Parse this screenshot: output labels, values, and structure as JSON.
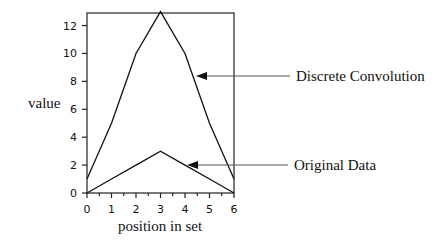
{
  "chart_data": {
    "type": "line",
    "title": "",
    "xlabel": "position in set",
    "ylabel": "value",
    "x": [
      0,
      1,
      2,
      3,
      4,
      5,
      6
    ],
    "xlim": [
      0,
      6
    ],
    "ylim": [
      0,
      12.9
    ],
    "xticks": [
      "0",
      "1",
      "2",
      "3",
      "4",
      "5",
      "6"
    ],
    "yticks": [
      "0",
      "2",
      "4",
      "6",
      "8",
      "10",
      "12"
    ],
    "grid": false,
    "legend": "none (inline arrow annotations)",
    "series": [
      {
        "name": "Discrete Convolution",
        "values": [
          1,
          5,
          10,
          13,
          10,
          5,
          1
        ]
      },
      {
        "name": "Original Data",
        "values": [
          0,
          1,
          2,
          3,
          2,
          1,
          0
        ]
      }
    ],
    "annotations": [
      {
        "text": "Discrete Convolution",
        "points_to_series": 0
      },
      {
        "text": "Original Data",
        "points_to_series": 1
      }
    ]
  },
  "labels": {
    "xlabel": "position in set",
    "ylabel": "value",
    "annot_conv": "Discrete Convolution",
    "annot_orig": "Original Data"
  }
}
